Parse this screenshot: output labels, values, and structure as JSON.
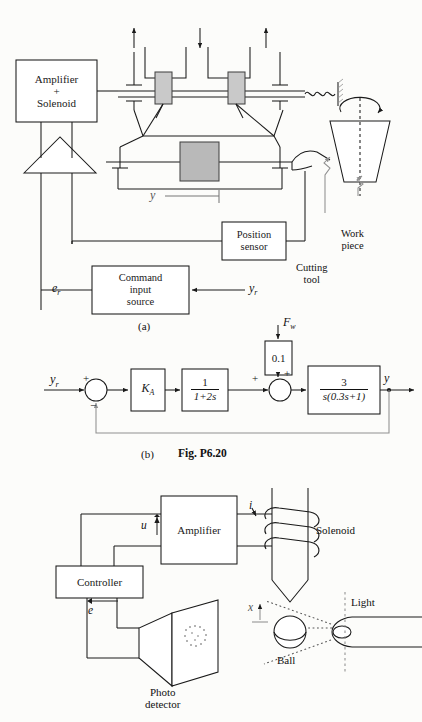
{
  "figure": {
    "caption": "Fig.  P6.20",
    "part_a_label": "(a)",
    "part_b_label": "(b)"
  },
  "diagram_a": {
    "title": "Precision machine tool position control schematic",
    "blocks": {
      "amplifier_solenoid_line1": "Amplifier",
      "amplifier_solenoid_line2": "+",
      "amplifier_solenoid_line3": "Solenoid",
      "position_sensor_line1": "Position",
      "position_sensor_line2": "sensor",
      "command_line1": "Command",
      "command_line2": "input",
      "command_line3": "source"
    },
    "labels": {
      "error": "e",
      "error_sub": "r",
      "reference": "y",
      "reference_sub": "r",
      "output": "y",
      "cutting_tool_line1": "Cutting",
      "cutting_tool_line2": "tool",
      "work_piece_line1": "Work",
      "work_piece_line2": "piece"
    }
  },
  "diagram_b": {
    "title": "Closed-loop block diagram",
    "input_label": "y",
    "input_sub": "r",
    "output_label": "y",
    "disturbance_label": "F",
    "disturbance_sub": "w",
    "sum1_plus": "+",
    "sum1_minus": "−",
    "sum2_plus_left": "+",
    "sum2_plus_top": "+",
    "blocks": [
      {
        "name": "gain",
        "text": "K",
        "sub": "A"
      },
      {
        "name": "lag",
        "numerator": "1",
        "denominator": "1+2s"
      },
      {
        "name": "disturbance-gain",
        "text": "0.1"
      },
      {
        "name": "plant",
        "numerator": "3",
        "denominator": "s(0.3s+1)"
      }
    ]
  },
  "diagram_c": {
    "title": "Magnetic ball suspension system",
    "blocks": {
      "amplifier": "Amplifier",
      "controller": "Controller"
    },
    "labels": {
      "control_signal": "u",
      "current": "i",
      "error": "e",
      "displacement": "x",
      "solenoid": "Solenoid",
      "ball": "Ball",
      "light": "Light",
      "photo_detector_line1": "Photo",
      "photo_detector_line2": "detector"
    }
  },
  "colors": {
    "line": "#1a1a1a",
    "block_fill": "#ffffff",
    "slider_gray": "#c9c9c9",
    "stage_gray": "#b9b9b9",
    "page": "#fcfcfa",
    "faint": "#8f8f8f"
  }
}
